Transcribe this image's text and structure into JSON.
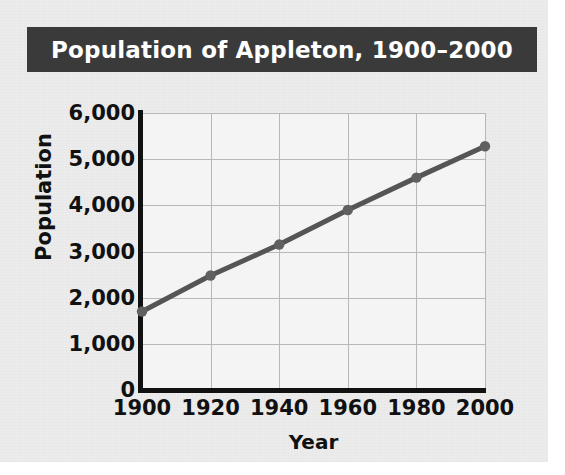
{
  "figure": {
    "title": "Population of Appleton, 1900–2000",
    "title_bar_color": "#3a3a3a",
    "title_text_color": "#ffffff",
    "background_color": "#ececec",
    "plot_background_color": "#f4f4f4"
  },
  "axes": {
    "x_title": "Year",
    "y_title": "Population",
    "axis_color": "#111111",
    "grid_color": "#b8b8b8"
  },
  "chart_data": {
    "type": "line",
    "title": "Population of Appleton, 1900–2000",
    "subtitle": "",
    "xlabel": "Year",
    "ylabel": "Population",
    "x": [
      1900,
      1920,
      1940,
      1960,
      1980,
      2000
    ],
    "values": [
      1700,
      2480,
      3150,
      3900,
      4600,
      5280
    ],
    "series": [
      {
        "name": "Population",
        "values": [
          1700,
          2480,
          3150,
          3900,
          4600,
          5280
        ]
      }
    ],
    "xlim": [
      1900,
      2000
    ],
    "ylim": [
      0,
      6000
    ],
    "x_ticks": [
      1900,
      1920,
      1940,
      1960,
      1980,
      2000
    ],
    "x_tick_labels": [
      "1900",
      "1920",
      "1940",
      "1960",
      "1980",
      "2000"
    ],
    "y_ticks": [
      0,
      1000,
      2000,
      3000,
      4000,
      5000,
      6000
    ],
    "y_tick_labels": [
      "0",
      "1,000",
      "2,000",
      "3,000",
      "4,000",
      "5,000",
      "6,000"
    ],
    "grid": true,
    "legend": false,
    "legend_position": "none",
    "line_color": "#555555",
    "marker_color": "#606060",
    "marker": "circle",
    "annotations": []
  }
}
